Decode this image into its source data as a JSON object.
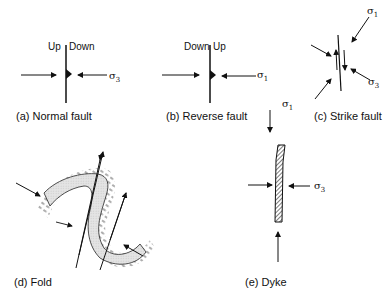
{
  "panels": {
    "a": {
      "caption": "(a) Normal fault",
      "left_label": "Up",
      "right_label": "Down",
      "stress_label": "σ",
      "stress_sub": "3"
    },
    "b": {
      "caption": "(b) Reverse fault",
      "left_label": "Down",
      "right_label": "Up",
      "stress_label": "σ",
      "stress_sub": "1"
    },
    "c": {
      "caption": "(c) Strike fault",
      "stress_top_label": "σ",
      "stress_top_sub": "1",
      "stress_right_label": "σ",
      "stress_right_sub": "3"
    },
    "d": {
      "caption": "(d) Fold",
      "stress_label": "σ",
      "stress_sub": "1"
    },
    "e": {
      "caption": "(e) Dyke",
      "stress_top_label": "σ",
      "stress_top_sub": "1",
      "stress_right_label": "σ",
      "stress_right_sub": "3"
    }
  }
}
